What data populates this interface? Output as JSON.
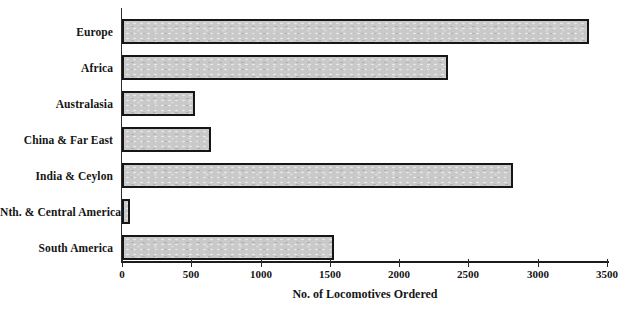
{
  "chart_data": {
    "type": "bar",
    "orientation": "horizontal",
    "title": "",
    "xlabel": "No. of Locomotives Ordered",
    "ylabel": "",
    "categories": [
      "Europe",
      "Africa",
      "Australasia",
      "China & Far East",
      "India & Ceylon",
      "Nth. & Central America",
      "South America"
    ],
    "values": [
      3370,
      2350,
      530,
      640,
      2820,
      60,
      1530
    ],
    "xlim": [
      0,
      3500
    ],
    "x_ticks": [
      0,
      500,
      1000,
      1500,
      2000,
      2500,
      3000,
      3500
    ],
    "grid": false,
    "legend": null,
    "bar_fill": "#c9c9c9",
    "bar_border": "#161616"
  },
  "colors": {
    "background": "#ffffff",
    "axis": "#1c1c1c",
    "text": "#151515"
  }
}
